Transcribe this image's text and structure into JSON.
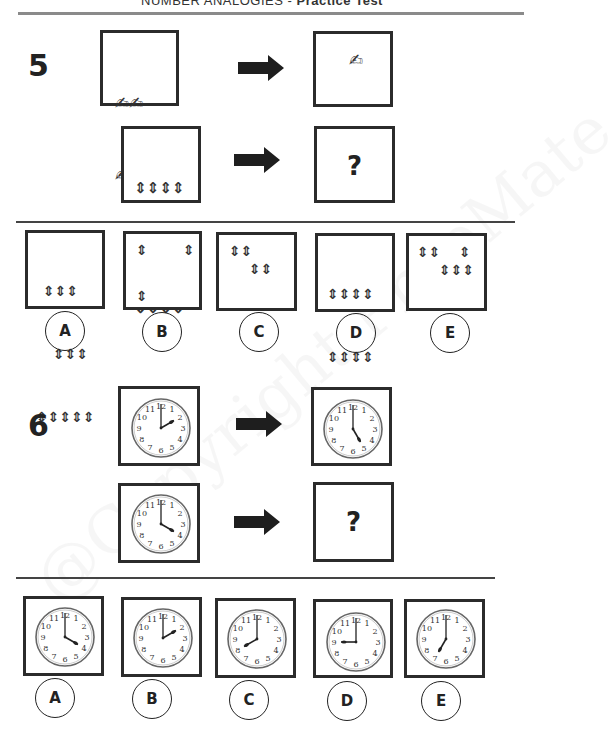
{
  "header": {
    "title_prefix": "NUMBER ANALOGIES - ",
    "title_bold": "Practice Test"
  },
  "watermark": "@Copyright PrepMate",
  "question5": {
    "number": "5",
    "example": {
      "from": {
        "symbol": "hand-writing-icon",
        "count": 4,
        "rows": [
          "✍✍",
          "✍✍"
        ]
      },
      "to": {
        "symbol": "hand-writing-icon",
        "count": 1,
        "rows": [
          "✍"
        ]
      }
    },
    "problem": {
      "from": {
        "symbol": "up-down-arrow-icon",
        "count": 12,
        "rows": [
          "⇕⇕⇕⇕",
          "⇕⇕⇕⇕",
          "⇕⇕⇕⇕"
        ]
      },
      "to": "?"
    },
    "options": [
      {
        "label": "A",
        "rows": [
          "⇕⇕⇕",
          "  ⇕⇕⇕",
          "⇕⇕⇕⇕⇕"
        ],
        "count": 11
      },
      {
        "label": "B",
        "rows": [
          "⇕",
          "",
          "⇕"
        ],
        "extra_top_right": "⇕",
        "count": 3
      },
      {
        "label": "C",
        "rows": [
          "⇕⇕",
          "   ⇕⇕"
        ],
        "count": 4
      },
      {
        "label": "D",
        "rows": [
          "⇕⇕⇕⇕",
          "⇕⇕⇕⇕",
          "⇕⇕"
        ],
        "count": 10
      },
      {
        "label": "E",
        "rows": [
          "⇕⇕   ⇕",
          "  ⇕⇕⇕"
        ],
        "count": 6
      }
    ]
  },
  "question6": {
    "number": "6",
    "example": {
      "from": {
        "time": "2:00",
        "hour": 2
      },
      "to": {
        "time": "5:00",
        "hour": 5
      }
    },
    "problem": {
      "from": {
        "time": "4:00",
        "hour": 4
      },
      "to": "?"
    },
    "options": [
      {
        "label": "A",
        "time": "4:00",
        "hour": 4
      },
      {
        "label": "B",
        "time": "2:00",
        "hour": 2
      },
      {
        "label": "C",
        "time": "8:00",
        "hour": 8
      },
      {
        "label": "D",
        "time": "9:00",
        "hour": 9
      },
      {
        "label": "E",
        "time": "7:00",
        "hour": 7
      }
    ]
  },
  "colors": {
    "ink": "#222222",
    "rule": "#8a8a8a",
    "border": "#2b2b2b"
  }
}
